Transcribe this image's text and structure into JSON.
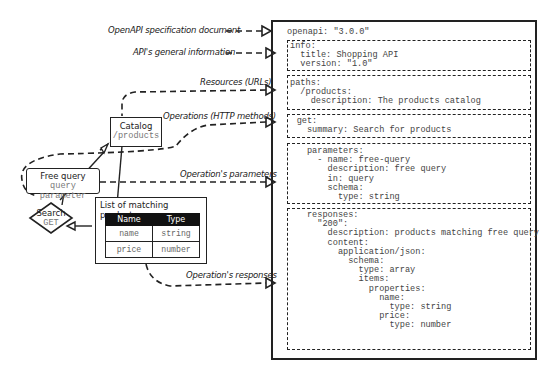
{
  "annotations": {
    "openapi_document": "OpenAPI specification document",
    "general_info": "API's general information",
    "resources": "Resources (URLs)",
    "operations": "Operations (HTTP methods)",
    "parameters": "Operation's parameters",
    "responses": "Operation's responses"
  },
  "spec": {
    "openapi_line": "openapi: \"3.0.0\"",
    "info": "info:\n  title: Shopping API\n  version: \"1.0\"",
    "paths": "paths:\n  /products:\n    description: The products catalog",
    "get": "    get:\n      summary: Search for products",
    "parameters": "      parameters:\n        - name: free-query\n          description: free query\n          in: query\n          schema:\n            type: string",
    "responses": "      responses:\n        \"200\":\n          description: products matching free query\n          content:\n            application/json:\n              schema:\n                type: array\n                items:\n                  properties:\n                    name:\n                      type: string\n                    price:\n                      type: number"
  },
  "model": {
    "catalog": {
      "title": "Catalog",
      "path": "/products"
    },
    "free_query": {
      "title": "Free query",
      "subtitle": "query parameter"
    },
    "search": {
      "title": "Search",
      "method": "GET"
    },
    "matching_products": {
      "title": "List of matching products",
      "columns": [
        "Name",
        "Type"
      ],
      "rows": [
        [
          "name",
          "string"
        ],
        [
          "price",
          "number"
        ]
      ]
    }
  }
}
